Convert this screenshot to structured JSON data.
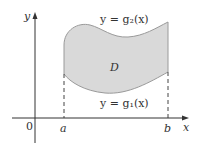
{
  "figure": {
    "type": "region-type-I",
    "region_label": "D",
    "upper_curve_label": "y = g₂(x)",
    "lower_curve_label": "y = g₁(x)",
    "axes": {
      "x_label": "x",
      "y_label": "y",
      "origin_label": "0"
    },
    "x_ticks": [
      "a",
      "b"
    ],
    "colors": {
      "region_fill": "#d9d9d9",
      "region_stroke": "#9a9a9a",
      "axis": "#333333",
      "dashed": "#444444"
    }
  }
}
